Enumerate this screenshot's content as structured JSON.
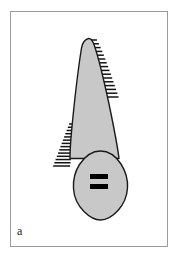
{
  "figure": {
    "panel_label": "a",
    "caption_text": "a",
    "background_color": "#ffffff",
    "frame_color": "#9b9b9b",
    "outline_color": "#1a1a1a",
    "fill_color": "#c8c8c8",
    "marking_color": "#000000"
  },
  "frame": {
    "x": 10,
    "y": 11,
    "width": 158,
    "height": 236
  },
  "diagram": {
    "type": "schematic-line-drawing",
    "title": "",
    "shapes": [
      {
        "name": "tapered-body",
        "label": "tapered root body",
        "fill": "#c8c8c8",
        "stroke": "#1a1a1a",
        "path": "M 88.5 38.5 C 84.5 39.5 82.5 43.0 81.5 48.0 C 78.0 70.0 74.0 105.0 71.5 132.0 C 70.5 143.0 70.0 152.0 70.0 158.5 L 119.0 158.5 C 118.0 150.0 114.0 128.0 109.0 104.0 C 103.0 76.0 97.0 53.0 94.0 44.5 C 92.5 40.3 90.8 38.2 88.5 38.5 Z"
      },
      {
        "name": "lower-oval-body",
        "label": "rounded lower body",
        "fill": "#c8c8c8",
        "stroke": "#1a1a1a",
        "path": "M 100.5 151.0 C 92.0 151.0 84.5 157.0 79.5 164.5 C 75.0 171.5 73.0 180.0 73.5 188.5 C 74.0 197.5 78.0 205.5 84.0 211.5 C 89.5 217.0 95.5 220.0 100.5 220.0 C 106.0 220.0 112.5 216.5 118.0 210.5 C 123.5 204.5 127.0 196.5 127.5 188.0 C 128.0 179.5 125.5 171.0 121.0 164.0 C 116.0 156.5 109.0 151.0 100.5 151.0 Z"
      }
    ],
    "hatch_groups": [
      {
        "name": "right-hatching",
        "label": "right edge tick marks",
        "side": "right",
        "count": 16,
        "stroke": "#141414",
        "y_start": 40,
        "y_end": 97,
        "length_min": 7,
        "length_max": 13
      },
      {
        "name": "left-hatching",
        "label": "left edge tick marks",
        "side": "left",
        "count": 14,
        "stroke": "#141414",
        "y_start": 124,
        "y_end": 166,
        "length_min": 6,
        "length_max": 17
      }
    ],
    "markings": [
      {
        "name": "upper-black-bar",
        "label": "upper solid bar",
        "x": 90,
        "y": 174,
        "width": 18,
        "height": 5,
        "color": "#000000"
      },
      {
        "name": "lower-black-bar",
        "label": "lower solid bar",
        "x": 90,
        "y": 184,
        "width": 18,
        "height": 5,
        "color": "#000000"
      }
    ]
  }
}
